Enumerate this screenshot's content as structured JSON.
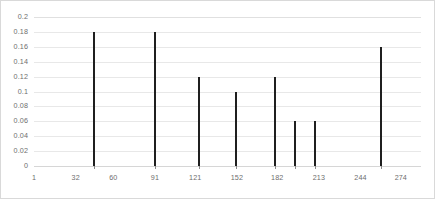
{
  "chart_data": {
    "type": "bar",
    "title": "",
    "xlabel": "",
    "ylabel": "",
    "grid": true,
    "legend": "none",
    "xlim": [
      1,
      289
    ],
    "ylim": [
      0,
      0.2
    ],
    "ytick_labels": [
      "0.2",
      "0.18",
      "0.16",
      "0.14",
      "0.12",
      "0.1",
      "0.08",
      "0.06",
      "0.04",
      "0.02",
      "0"
    ],
    "ytick_values": [
      0.2,
      0.18,
      0.16,
      0.14,
      0.12,
      0.1,
      0.08,
      0.06,
      0.04,
      0.02,
      0
    ],
    "xtick_labels": [
      "1",
      "32",
      "60",
      "91",
      "121",
      "152",
      "182",
      "213",
      "244",
      "274"
    ],
    "xtick_values": [
      1,
      32,
      60,
      91,
      121,
      152,
      182,
      213,
      244,
      274
    ],
    "x": [
      46,
      91,
      124,
      151,
      180,
      195,
      210,
      259
    ],
    "values": [
      0.18,
      0.18,
      0.12,
      0.1,
      0.12,
      0.06,
      0.06,
      0.16
    ],
    "bars": [
      {
        "x": 46,
        "value": 0.18
      },
      {
        "x": 91,
        "value": 0.18
      },
      {
        "x": 124,
        "value": 0.12
      },
      {
        "x": 151,
        "value": 0.1
      },
      {
        "x": 180,
        "value": 0.12
      },
      {
        "x": 195,
        "value": 0.06
      },
      {
        "x": 210,
        "value": 0.06
      },
      {
        "x": 259,
        "value": 0.16
      }
    ],
    "bar_color": "#1f1f1f",
    "gridline_color": "#e8e8e8",
    "axis_label_color": "#6e6e6e",
    "plot_background": "#ffffff",
    "border_color": "#d9d9d9"
  }
}
